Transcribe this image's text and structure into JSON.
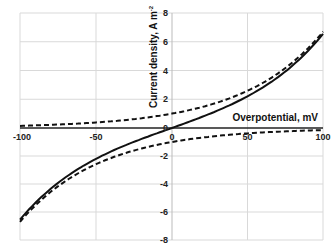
{
  "chart_data": {
    "type": "line",
    "title": "",
    "xlabel": "Overpotential, mV",
    "ylabel": "Current density, A m⁻²",
    "xlim": [
      -100,
      100
    ],
    "ylim": [
      -8,
      8
    ],
    "x_ticks": [
      -100,
      -50,
      0,
      50,
      100
    ],
    "y_ticks": [
      -8,
      -6,
      -4,
      -2,
      0,
      2,
      4,
      6,
      8
    ],
    "grid": true,
    "legend": null,
    "x": [
      -100,
      -75,
      -50,
      -25,
      0,
      25,
      50,
      75,
      100
    ],
    "series": [
      {
        "name": "net current (solid)",
        "style": "solid",
        "values": [
          -6.8,
          -4.1,
          -2.3,
          -1.0,
          0.0,
          1.0,
          2.3,
          4.1,
          6.7
        ]
      },
      {
        "name": "anodic partial current (dashed upper)",
        "style": "dashed",
        "values": [
          0.15,
          0.25,
          0.45,
          0.65,
          1.0,
          1.6,
          2.6,
          4.2,
          6.7
        ]
      },
      {
        "name": "cathodic partial current (dashed lower)",
        "style": "dashed",
        "values": [
          -6.8,
          -4.2,
          -2.6,
          -1.6,
          -1.0,
          -0.65,
          -0.45,
          -0.25,
          -0.15
        ]
      }
    ]
  },
  "labels": {
    "xlabel": "Overpotential, mV",
    "ylabel": "Current density, A m",
    "ylabel_sup": "-2",
    "x_ticks": [
      "-100",
      "-50",
      "0",
      "50",
      "100"
    ],
    "y_ticks": [
      "8",
      "6",
      "4",
      "2",
      "0",
      "-2",
      "-4",
      "-6",
      "-8"
    ]
  }
}
